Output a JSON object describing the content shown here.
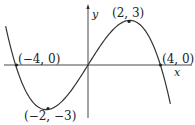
{
  "chart_data": {
    "type": "line",
    "title": "",
    "xlabel": "x",
    "ylabel": "y",
    "grid": false,
    "legend": null,
    "series": [
      {
        "name": "cubic curve",
        "description": "Cubic with zeros at x=-4, 0, 4; local min (-2,-3), local max (2,3)",
        "points": [
          [
            -4.5,
            1.6
          ],
          [
            -4,
            0
          ],
          [
            -2,
            -3
          ],
          [
            0,
            0
          ],
          [
            2,
            3
          ],
          [
            4,
            0
          ],
          [
            4.5,
            -1.6
          ]
        ]
      }
    ],
    "annotations": [
      {
        "label": "(-4, 0)",
        "x": -4,
        "y": 0
      },
      {
        "label": "(-2, -3)",
        "x": -2,
        "y": -3
      },
      {
        "label": "(2, 3)",
        "x": 2,
        "y": 3
      },
      {
        "label": "(4, 0)",
        "x": 4,
        "y": 0
      }
    ],
    "xlim": [
      -4.7,
      5.6
    ],
    "ylim": [
      -3.6,
      4.1
    ]
  },
  "labels": {
    "p1": "(−4, 0)",
    "p2": "(−2, −3)",
    "p3": "(2, 3)",
    "p4": "(4, 0)",
    "x_axis": "x",
    "y_axis": "y"
  }
}
